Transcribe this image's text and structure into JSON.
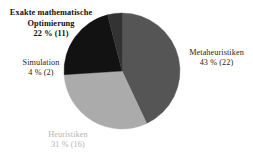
{
  "chart_data": {
    "type": "pie",
    "title": "",
    "subtitle": "",
    "xlabel": "",
    "ylabel": "",
    "legend_position": "none",
    "grid": false,
    "unit_note": "percent of total with absolute count in parentheses",
    "total_count": 51,
    "start_angle_deg": 0,
    "direction": "clockwise",
    "categories": [
      "Metaheuristiken",
      "Heuristiken",
      "Exakte mathematische Optimierung",
      "Simulation"
    ],
    "values": [
      43,
      31,
      22,
      4
    ],
    "counts": [
      22,
      16,
      11,
      2
    ],
    "colors": [
      "#555555",
      "#ababab",
      "#121212",
      "#333333"
    ],
    "slices": [
      {
        "name": "Metaheuristiken",
        "percent": 43,
        "count": 22,
        "label_name": "Metaheuristiken",
        "label_value": "43 % (22)",
        "color": "#555555",
        "label_color": "#242424",
        "label_position": "right"
      },
      {
        "name": "Heuristiken",
        "percent": 31,
        "count": 16,
        "label_name": "Heuristiken",
        "label_value": "31 % (16)",
        "color": "#ababab",
        "label_color": "#b4b4b4",
        "label_position": "bottom"
      },
      {
        "name": "Exakte mathematische Optimierung",
        "percent": 22,
        "count": 11,
        "label_name": "Exakte mathematische Optimierung",
        "label_value": "22 % (11)",
        "color": "#121212",
        "label_color": "#101010",
        "label_position": "top-left"
      },
      {
        "name": "Simulation",
        "percent": 4,
        "count": 2,
        "label_name": "Simulation",
        "label_value": "4 % (2)",
        "color": "#333333",
        "label_color": "#1d1d1d",
        "label_position": "left"
      }
    ],
    "geometry": {
      "center_x": 122,
      "center_y": 71,
      "radius": 58
    },
    "background_color": "#ffffff"
  }
}
